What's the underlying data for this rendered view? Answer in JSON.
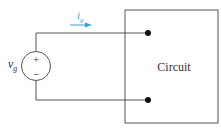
{
  "diagram": {
    "source": {
      "label": "v",
      "subscript": "g",
      "plus": "+",
      "minus": "−"
    },
    "current": {
      "label": "i",
      "subscript": "g",
      "arrow_color": "#3aa0d0"
    },
    "box": {
      "label": "Circuit"
    },
    "colors": {
      "line": "#555555",
      "dot": "#111111",
      "text": "#333333"
    }
  }
}
